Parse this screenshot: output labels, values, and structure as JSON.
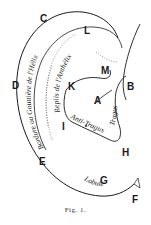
{
  "figure": {
    "caption": "Fig. 1.",
    "stroke_color": "#1a1a1a",
    "background": "#ffffff"
  },
  "letters": [
    {
      "id": "A",
      "text": "A",
      "x": 94,
      "y": 96
    },
    {
      "id": "B",
      "text": "B",
      "x": 127,
      "y": 82
    },
    {
      "id": "C",
      "text": "C",
      "x": 40,
      "y": 14
    },
    {
      "id": "D",
      "text": "D",
      "x": 12,
      "y": 81
    },
    {
      "id": "E",
      "text": "E",
      "x": 39,
      "y": 157
    },
    {
      "id": "F",
      "text": "F",
      "x": 132,
      "y": 195
    },
    {
      "id": "G",
      "text": "G",
      "x": 100,
      "y": 176
    },
    {
      "id": "H",
      "text": "H",
      "x": 122,
      "y": 148
    },
    {
      "id": "I",
      "text": "I",
      "x": 62,
      "y": 122
    },
    {
      "id": "K",
      "text": "K",
      "x": 68,
      "y": 82
    },
    {
      "id": "L",
      "text": "L",
      "x": 84,
      "y": 26
    },
    {
      "id": "M",
      "text": "M",
      "x": 101,
      "y": 66
    }
  ],
  "curved_labels": {
    "helix_border": "Bordure ou Gouttière de l'Hélix",
    "antihelix": "Replis de l'Anthélix",
    "tragus": "Tragus",
    "antitragus": "Anti-Tragus",
    "lobule": "Lobule"
  }
}
